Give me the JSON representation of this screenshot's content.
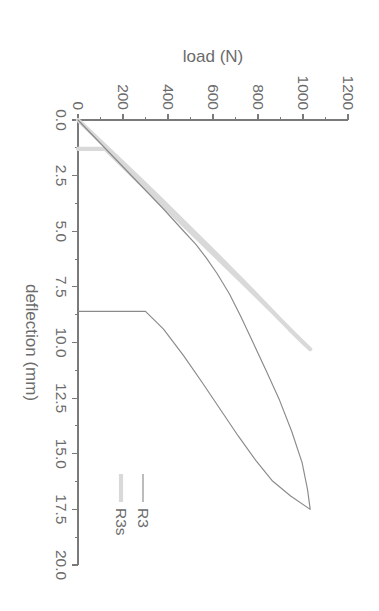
{
  "chart_data": {
    "type": "line",
    "title": "",
    "xlabel": "deflection (mm)",
    "ylabel": "load (N)",
    "xlim": [
      0.0,
      20.0
    ],
    "ylim": [
      0,
      1200
    ],
    "grid": false,
    "orientation": "rotated-90-clockwise",
    "legend_position": "right",
    "xticks": [
      "0.0",
      "2.5",
      "5.0",
      "7.5",
      "10.0",
      "12.5",
      "15.0",
      "17.5",
      "20.0"
    ],
    "xtick_values": [
      0.0,
      2.5,
      5.0,
      7.5,
      10.0,
      12.5,
      15.0,
      17.5,
      20.0
    ],
    "yticks": [
      "0",
      "200",
      "400",
      "600",
      "800",
      "1000",
      "1200"
    ],
    "ytick_values": [
      0,
      200,
      400,
      600,
      800,
      1000,
      1200
    ],
    "minor_ticks_per_interval": 1,
    "series": [
      {
        "name": "R3",
        "color": "#8a8a8a",
        "line_width": 1.15,
        "points": [
          [
            0.0,
            0
          ],
          [
            1.0,
            95
          ],
          [
            2.0,
            190
          ],
          [
            3.0,
            285
          ],
          [
            4.0,
            380
          ],
          [
            5.0,
            470
          ],
          [
            5.6,
            525
          ],
          [
            6.2,
            570
          ],
          [
            6.9,
            618
          ],
          [
            7.8,
            672
          ],
          [
            8.8,
            722
          ],
          [
            10.0,
            778
          ],
          [
            11.3,
            838
          ],
          [
            12.6,
            896
          ],
          [
            14.0,
            950
          ],
          [
            15.4,
            996
          ],
          [
            16.6,
            1020
          ],
          [
            17.5,
            1032
          ],
          [
            16.9,
            945
          ],
          [
            16.2,
            862
          ],
          [
            15.3,
            790
          ],
          [
            14.2,
            712
          ],
          [
            13.0,
            632
          ],
          [
            11.8,
            552
          ],
          [
            10.6,
            470
          ],
          [
            9.4,
            380
          ],
          [
            8.6,
            300
          ],
          [
            8.6,
            0
          ]
        ]
      },
      {
        "name": "R3s",
        "color": "#d9d9d9",
        "line_width": 4.2,
        "points": [
          [
            0.0,
            0
          ],
          [
            1.2,
            125
          ],
          [
            2.4,
            250
          ],
          [
            3.6,
            372
          ],
          [
            4.8,
            492
          ],
          [
            6.0,
            612
          ],
          [
            7.2,
            730
          ],
          [
            8.4,
            845
          ],
          [
            9.4,
            940
          ],
          [
            10.0,
            1000
          ],
          [
            10.3,
            1032
          ],
          [
            9.6,
            960
          ],
          [
            8.6,
            862
          ],
          [
            7.4,
            742
          ],
          [
            6.2,
            620
          ],
          [
            5.0,
            498
          ],
          [
            3.8,
            375
          ],
          [
            2.6,
            252
          ],
          [
            1.3,
            122
          ],
          [
            1.3,
            0
          ]
        ]
      }
    ]
  },
  "legend": {
    "items": [
      {
        "label": "R3"
      },
      {
        "label": "R3s"
      }
    ]
  },
  "axes": {
    "load": {
      "title": "load (N)",
      "ticks": [
        "0",
        "200",
        "400",
        "600",
        "800",
        "1000",
        "1200"
      ]
    },
    "deflection": {
      "title": "deflection (mm)",
      "ticks": [
        "0.0",
        "2.5",
        "5.0",
        "7.5",
        "10.0",
        "12.5",
        "15.0",
        "17.5",
        "20.0"
      ]
    }
  }
}
